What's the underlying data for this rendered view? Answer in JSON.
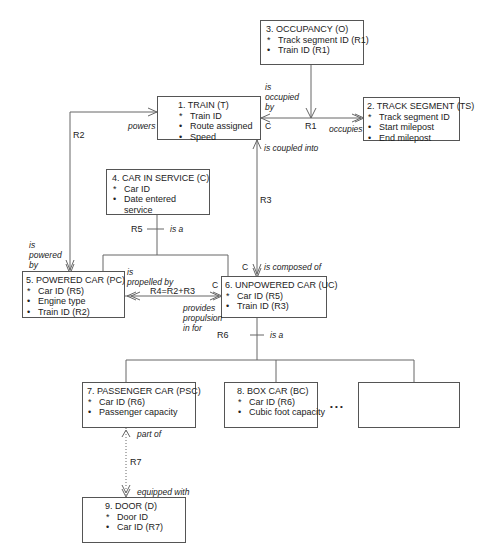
{
  "objects": [
    {
      "id": "occupancy",
      "title": "3. OCCUPANCY (O)",
      "attributes": [
        {
          "mark": "*",
          "text": "Track segment ID (R1)"
        },
        {
          "mark": "•",
          "text": "Train ID (R1)"
        }
      ]
    },
    {
      "id": "train",
      "title": "1. TRAIN (T)",
      "attributes": [
        {
          "mark": "*",
          "text": "Train ID"
        },
        {
          "mark": "•",
          "text": "Route assigned"
        },
        {
          "mark": "•",
          "text": "Speed"
        }
      ]
    },
    {
      "id": "track-segment",
      "title": "2. TRACK SEGMENT (TS)",
      "attributes": [
        {
          "mark": "*",
          "text": "Track segment ID"
        },
        {
          "mark": "•",
          "text": "Start milepost"
        },
        {
          "mark": "•",
          "text": "End milepost"
        }
      ]
    },
    {
      "id": "car-in-service",
      "title": "4. CAR IN SERVICE (C)",
      "attributes": [
        {
          "mark": "*",
          "text": "Car ID"
        },
        {
          "mark": "•",
          "text": "Date entered"
        },
        {
          "mark": "",
          "text": "service"
        }
      ]
    },
    {
      "id": "powered-car",
      "title": "5. POWERED CAR (PC)",
      "attributes": [
        {
          "mark": "*",
          "text": "Car ID (R5)"
        },
        {
          "mark": "•",
          "text": "Engine type"
        },
        {
          "mark": "•",
          "text": "Train ID (R2)"
        }
      ]
    },
    {
      "id": "unpowered-car",
      "title": "6. UNPOWERED CAR (UC)",
      "attributes": [
        {
          "mark": "*",
          "text": "Car ID (R5)"
        },
        {
          "mark": "•",
          "text": "Train ID (R3)"
        }
      ]
    },
    {
      "id": "passenger-car",
      "title": "7. PASSENGER CAR (PSC)",
      "attributes": [
        {
          "mark": "*",
          "text": "Car ID (R6)"
        },
        {
          "mark": "•",
          "text": "Passenger capacity"
        }
      ]
    },
    {
      "id": "box-car",
      "title": "8. BOX CAR (BC)",
      "attributes": [
        {
          "mark": "*",
          "text": "Car ID (R6)"
        },
        {
          "mark": "•",
          "text": "Cubic foot capacity"
        }
      ]
    },
    {
      "id": "door",
      "title": "9. DOOR (D)",
      "attributes": [
        {
          "mark": "*",
          "text": "Door ID"
        },
        {
          "mark": "•",
          "text": "Car ID (R7)"
        }
      ]
    }
  ],
  "relationships": {
    "r1": {
      "id": "R1",
      "forward": "occupies",
      "reverse_1": "is",
      "reverse_2": "occupied",
      "reverse_3": "by",
      "conditional": "C"
    },
    "r2": {
      "id": "R2",
      "forward": "powers",
      "reverse_1": "is",
      "reverse_2": "powered",
      "reverse_3": "by"
    },
    "r3": {
      "id": "R3",
      "forward": "is coupled into",
      "reverse": "is composed of",
      "conditional": "C"
    },
    "r4": {
      "id": "R4=R2+R3",
      "forward_1": "is",
      "forward_2": "propelled by",
      "reverse_1": "provides",
      "reverse_2": "propulsion",
      "reverse_3": "in for",
      "conditional": "C"
    },
    "r5": {
      "id": "R5",
      "label": "is a"
    },
    "r6": {
      "id": "R6",
      "label": "is a"
    },
    "r7": {
      "id": "R7",
      "forward": "part of",
      "reverse": "equipped with"
    }
  },
  "ellipsis": "• • •"
}
